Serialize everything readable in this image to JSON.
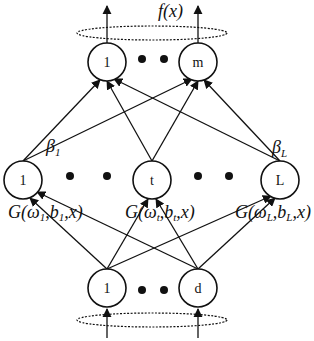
{
  "output_label": "f(x)",
  "output_nodes": [
    "1",
    "m"
  ],
  "hidden_nodes": [
    "1",
    "t",
    "L"
  ],
  "input_nodes": [
    "1",
    "d"
  ],
  "beta_labels": [
    {
      "symbol": "β",
      "sub": "1"
    },
    {
      "symbol": "β",
      "sub": "L"
    }
  ],
  "activation_labels": [
    {
      "prefix": "G(ω",
      "w_sub": "1",
      "mid": ",b",
      "b_sub": "1",
      "suffix": ",x)"
    },
    {
      "prefix": "G(ω",
      "w_sub": "t",
      "mid": ",b",
      "b_sub": "t",
      "suffix": ",x)"
    },
    {
      "prefix": "G(ω",
      "w_sub": "L",
      "mid": ",b",
      "b_sub": "L",
      "suffix": ",x)"
    }
  ],
  "ellipsis_dots": "• •"
}
